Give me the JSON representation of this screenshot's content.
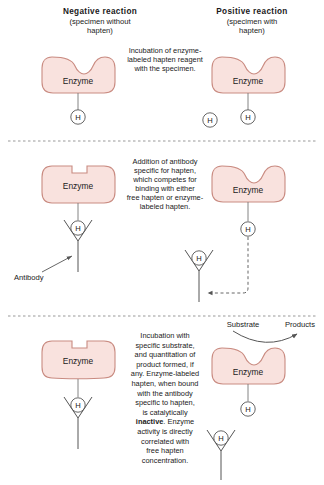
{
  "figure": {
    "title_negative_main": "Negative reaction",
    "title_negative_sub1": "(specimen without",
    "title_negative_sub2": "hapten)",
    "title_positive_main": "Positive reaction",
    "title_positive_sub1": "(specimen with",
    "title_positive_sub2": "hapten)"
  },
  "colors": {
    "enzyme_fill": "#f9e2de",
    "enzyme_stroke": "#c98b81",
    "line": "#555555",
    "divider": "#999999",
    "text": "#1a1a1a"
  },
  "labels": {
    "enzyme": "Enzyme",
    "hapten": "H",
    "antibody": "Antibody",
    "substrate": "Substrate",
    "products": "Products"
  },
  "panels": [
    {
      "id": "panel-incubation",
      "caption_lines": [
        "Incubation of enzyme-",
        "labeled hapten reagent",
        "with the specimen."
      ]
    },
    {
      "id": "panel-antibody-addition",
      "caption_lines": [
        "Addition of antibody",
        "specific for hapten,",
        "which competes for",
        "binding with either",
        "free hapten or enzyme-",
        "labeled hapten."
      ]
    },
    {
      "id": "panel-substrate-incubation",
      "caption_lines": [
        "Incubation with",
        "specific substrate,",
        "and quantitation of",
        "product formed, if",
        "any. Enzyme-labeled",
        "hapten, when bound",
        "with the antibody",
        "specific to hapten,",
        "is catalytically"
      ],
      "caption_bold_word": "inactive",
      "caption_lines_after": [
        ". Enzyme",
        "activity is directly",
        "correlated with",
        "free hapten",
        "concentration."
      ]
    }
  ]
}
